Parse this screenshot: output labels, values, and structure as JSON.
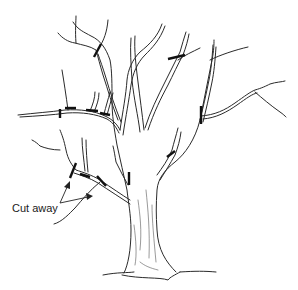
{
  "figure": {
    "annotation": {
      "label": "Cut away"
    },
    "colors": {
      "line": "#2a2a2a",
      "cut_mark": "#111111",
      "background": "#ffffff"
    },
    "cut_marks_count": 11
  }
}
